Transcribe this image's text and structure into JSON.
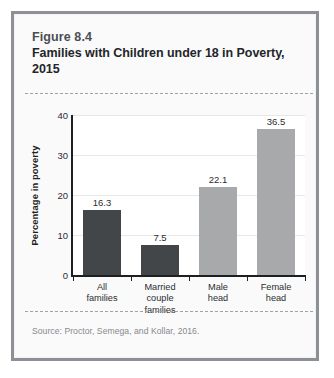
{
  "figure": {
    "number": "Figure 8.4",
    "title": "Families with Children under 18 in Poverty, 2015",
    "source": "Source: Proctor, Semega, and Kollar, 2016."
  },
  "colors": {
    "frame_border": "#8d9094",
    "panel_background": "#fafafb",
    "plot_background": "#ffffff",
    "axis": "#1d1f21",
    "gridline": "#e6e7e8",
    "dashed_rule": "#9fa3a7",
    "bar_dark": "#434649",
    "bar_light": "#a8a9ab",
    "title_text": "#232629",
    "figure_number_text": "#4a4e52",
    "source_text": "#86898d"
  },
  "chart_data": {
    "type": "bar",
    "title": "Families with Children under 18 in Poverty, 2015",
    "subtitle": "Figure 8.4",
    "xlabel": "",
    "ylabel": "Percentage in poverty",
    "categories": [
      "All families",
      "Married couple families",
      "Male head",
      "Female head"
    ],
    "category_lines": [
      [
        "All",
        "families"
      ],
      [
        "Married",
        "couple",
        "families"
      ],
      [
        "Male",
        "head"
      ],
      [
        "Female",
        "head"
      ]
    ],
    "values": [
      16.3,
      7.5,
      22.1,
      36.5
    ],
    "value_labels": [
      "16.3",
      "7.5",
      "22.1",
      "36.5"
    ],
    "bar_colors": [
      "#434649",
      "#434649",
      "#a8a9ab",
      "#a8a9ab"
    ],
    "ylim": [
      0,
      40
    ],
    "yticks": [
      0,
      10,
      20,
      30,
      40
    ],
    "ytick_labels": [
      "0",
      "10",
      "20",
      "30",
      "40"
    ],
    "grid": true,
    "legend": "none",
    "annotations": [
      "Source: Proctor, Semega, and Kollar, 2016."
    ]
  }
}
